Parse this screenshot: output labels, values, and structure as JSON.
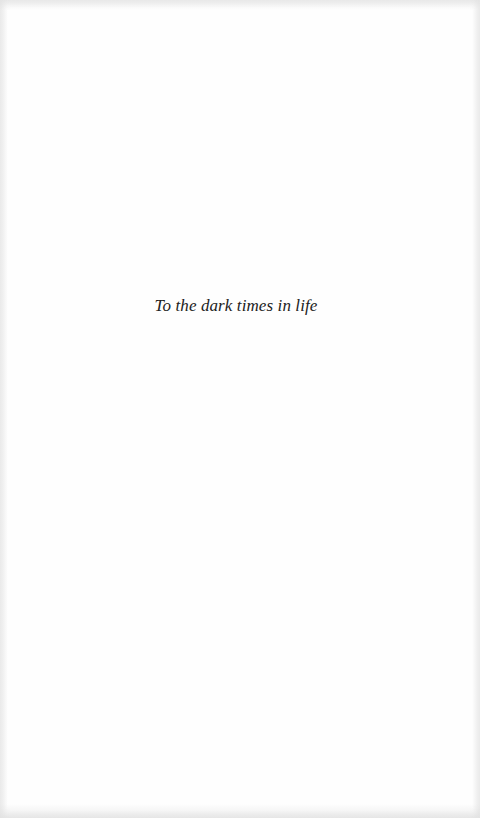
{
  "page": {
    "type": "dedication",
    "dedication_text": "To the dark times in life"
  },
  "colors": {
    "background": "#fefefe",
    "text": "#222222"
  }
}
